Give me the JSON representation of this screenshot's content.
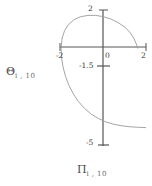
{
  "chart_data": {
    "type": "line",
    "title": "",
    "xlabel": "Π",
    "xlabel_sub": "i , 10",
    "ylabel": "Θ",
    "ylabel_sub": "i , 10",
    "xlim": [
      -2,
      2
    ],
    "ylim": [
      -5,
      2
    ],
    "xticks": [
      -2,
      0,
      2
    ],
    "xtick_labels": [
      "-2",
      "0",
      "2"
    ],
    "yticks": [
      2,
      -1.5,
      -5
    ],
    "ytick_labels": [
      "2",
      "-1.5",
      "-5"
    ],
    "grid": false,
    "legend": null,
    "axis_color": "#555555",
    "curve_color": "#9a9a9a",
    "background": "#ffffff",
    "series": [
      {
        "name": "spiral",
        "comment": "open spiral arc: starts lower-left near (-2,-4.6), sweeps up the left side crossing x=-2 at y=0, arcs over the top peaking near (-0.35,1.72), descends on the right to meet y=0 near x=1.62, then continues down-right off the lower-right region",
        "points": [
          [
            -1.95,
            0.02
          ],
          [
            -1.9,
            0.55
          ],
          [
            -1.78,
            0.95
          ],
          [
            -1.6,
            1.25
          ],
          [
            -1.35,
            1.5
          ],
          [
            -1.05,
            1.65
          ],
          [
            -0.7,
            1.72
          ],
          [
            -0.35,
            1.72
          ],
          [
            0.0,
            1.66
          ],
          [
            0.35,
            1.54
          ],
          [
            0.7,
            1.35
          ],
          [
            1.0,
            1.12
          ],
          [
            1.25,
            0.85
          ],
          [
            1.45,
            0.5
          ],
          [
            1.58,
            0.15
          ],
          [
            1.62,
            0.0
          ],
          [
            -1.95,
            0.02
          ],
          [
            -1.93,
            -0.45
          ],
          [
            -1.86,
            -0.95
          ],
          [
            -1.74,
            -1.45
          ],
          [
            -1.58,
            -1.92
          ],
          [
            -1.38,
            -2.35
          ],
          [
            -1.14,
            -2.75
          ],
          [
            -0.86,
            -3.1
          ],
          [
            -0.55,
            -3.4
          ],
          [
            -0.22,
            -3.62
          ],
          [
            0.12,
            -3.8
          ],
          [
            0.48,
            -3.92
          ],
          [
            0.85,
            -4.0
          ],
          [
            1.22,
            -4.05
          ],
          [
            1.6,
            -4.08
          ],
          [
            2.0,
            -4.1
          ]
        ]
      }
    ]
  },
  "axes": {
    "y_title": "Θ",
    "y_title_sub": "i , 10",
    "x_title": "Π",
    "x_title_sub": "i , 10",
    "y_tick_top": "2",
    "y_tick_mid": "-1.5",
    "y_tick_bottom": "-5",
    "x_tick_left": "-2",
    "x_tick_center": "0",
    "x_tick_right": "2"
  }
}
